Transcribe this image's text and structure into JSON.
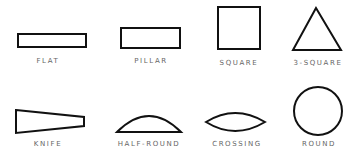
{
  "colors": {
    "stroke": "#111111",
    "label": "#666666",
    "background": "#ffffff"
  },
  "shapes": [
    {
      "name": "flat",
      "label": "FLAT",
      "fill": "diagonal-hatch"
    },
    {
      "name": "pillar",
      "label": "PILLAR",
      "fill": "diagonal-hatch"
    },
    {
      "name": "square",
      "label": "SQUARE",
      "fill": "diagonal-hatch"
    },
    {
      "name": "3-square",
      "label": "3-SQUARE",
      "fill": "diagonal-hatch"
    },
    {
      "name": "knife",
      "label": "KNIFE",
      "fill": "diagonal-hatch"
    },
    {
      "name": "half-round",
      "label": "HALF-ROUND",
      "fill": "diagonal-hatch"
    },
    {
      "name": "crossing",
      "label": "CROSSING",
      "fill": "diagonal-hatch"
    },
    {
      "name": "round",
      "label": "ROUND",
      "fill": "diagonal-hatch"
    }
  ]
}
